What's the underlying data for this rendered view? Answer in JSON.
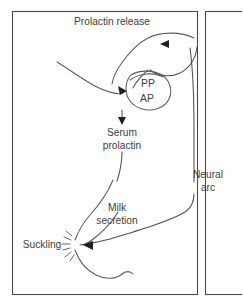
{
  "figure": {
    "kind": "prolactin-release-neuroendocrine-reflex-diagram",
    "background_color": "#ffffff",
    "line_color": "#5c5c5c",
    "text_color": "#3d3d3d",
    "frame_color": "#4a4a4a"
  },
  "labels": {
    "title": "Prolactin release",
    "posterior_pituitary": "PP",
    "anterior_pituitary": "AP",
    "serum_line1": "Serum",
    "serum_line2": "prolactin",
    "neural_line1": "Neural",
    "neural_line2": "arc",
    "milk_line1": "Milk",
    "milk_line2": "secretion",
    "suckling": "Suckling"
  },
  "icons": {
    "arrow_to_pituitary": "arrow-head-icon",
    "arrow_to_serum": "arrow-head-icon",
    "arrow_feedback_top": "arrow-head-icon",
    "arrow_to_nipple": "arrow-head-icon",
    "nipple_stimulation": "starburst-icon"
  }
}
